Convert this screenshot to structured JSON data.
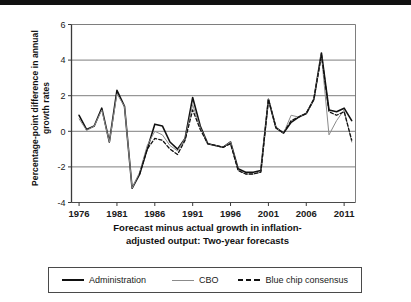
{
  "figure": {
    "y_axis_title": "Percentage-point difference in annual growth rates",
    "x_axis_title_line1": "Forecast minus actual growth in inflation-",
    "x_axis_title_line2": "adjusted output: Two-year forecasts"
  },
  "legend": {
    "items": [
      {
        "label": "Administration",
        "style": "solid-thick",
        "color": "#111111"
      },
      {
        "label": "CBO",
        "style": "solid-thin",
        "color": "#8b8b8b"
      },
      {
        "label": "Blue chip consensus",
        "style": "dashed",
        "color": "#111111"
      }
    ]
  },
  "chart_data": {
    "type": "line",
    "title": "",
    "subtitle": "",
    "xlabel": "Forecast minus actual growth in inflation-adjusted output: Two-year forecasts",
    "ylabel": "Percentage-point difference in annual growth rates",
    "xlim": [
      1975.0,
      2012.5
    ],
    "ylim": [
      -4,
      6
    ],
    "yticks": [
      -4,
      -2,
      0,
      2,
      4,
      6
    ],
    "ytick_labels": [
      "-4",
      "-2",
      "0",
      "2",
      "4",
      "6"
    ],
    "xticks": [
      1976,
      1981,
      1986,
      1991,
      1996,
      2001,
      2006,
      2011
    ],
    "xtick_labels": [
      "1976",
      "1981",
      "1986",
      "1991",
      "1996",
      "2001",
      "2006",
      "2011"
    ],
    "grid": "horizontal",
    "legend_position": "below",
    "x": [
      1976,
      1977,
      1978,
      1979,
      1980,
      1981,
      1982,
      1983,
      1984,
      1985,
      1986,
      1987,
      1988,
      1989,
      1990,
      1991,
      1992,
      1993,
      1994,
      1995,
      1996,
      1997,
      1998,
      1999,
      2000,
      2001,
      2002,
      2003,
      2004,
      2005,
      2006,
      2007,
      2008,
      2009,
      2010,
      2011,
      2012
    ],
    "series": [
      {
        "name": "Administration",
        "color": "#111111",
        "style": "solid-thick",
        "values": [
          0.9,
          0.1,
          0.3,
          1.3,
          -0.6,
          2.3,
          1.4,
          -3.2,
          -2.4,
          -1.0,
          0.4,
          0.3,
          -0.6,
          -1.0,
          -0.4,
          1.9,
          0.3,
          -0.7,
          -0.8,
          -0.9,
          -0.6,
          -2.1,
          -2.3,
          -2.3,
          -2.2,
          1.8,
          0.2,
          -0.1,
          0.5,
          0.8,
          1.0,
          1.8,
          4.4,
          1.2,
          1.1,
          1.3,
          0.6
        ]
      },
      {
        "name": "CBO",
        "color": "#8b8b8b",
        "style": "solid-thin",
        "values": [
          0.7,
          0.05,
          0.3,
          1.2,
          -0.6,
          2.1,
          1.4,
          -3.2,
          -2.3,
          -0.8,
          0.0,
          -0.2,
          -0.8,
          -1.1,
          -0.4,
          1.5,
          0.2,
          -0.7,
          -0.8,
          -0.9,
          -0.6,
          -2.2,
          -2.4,
          -2.4,
          -2.3,
          1.8,
          0.2,
          -0.1,
          0.9,
          0.8,
          1.0,
          1.8,
          4.3,
          -0.2,
          0.6,
          1.2,
          -0.6
        ]
      },
      {
        "name": "Blue chip consensus",
        "color": "#111111",
        "style": "dashed",
        "values": [
          null,
          null,
          null,
          null,
          null,
          null,
          null,
          null,
          -2.4,
          -1.0,
          -0.4,
          -0.5,
          -1.0,
          -1.3,
          -0.5,
          1.2,
          0.1,
          -0.7,
          -0.8,
          -0.9,
          -0.7,
          -2.2,
          -2.4,
          -2.4,
          -2.3,
          1.8,
          0.2,
          -0.1,
          0.6,
          0.8,
          1.0,
          1.8,
          4.3,
          1.1,
          0.9,
          1.1,
          -0.5
        ]
      }
    ]
  }
}
